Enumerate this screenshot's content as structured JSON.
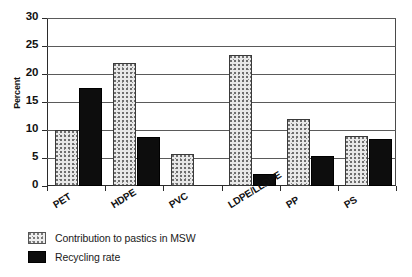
{
  "chart_data": {
    "type": "bar",
    "title": "",
    "subtitle": "",
    "xlabel": "",
    "ylabel": "Percent",
    "ylim": [
      0,
      30
    ],
    "ytick_values": [
      0,
      5,
      10,
      15,
      20,
      25,
      30
    ],
    "ytick_labels": [
      "0",
      "5",
      "10",
      "15",
      "20",
      "25",
      "30"
    ],
    "grid": true,
    "grid_axis": "y",
    "legend_position": "below-left",
    "categories": [
      "PET",
      "HDPE",
      "PVC",
      "LDPE/LLDPE",
      "PP",
      "PS"
    ],
    "series": [
      {
        "name": "Contribution to pastics in MSW",
        "color": "#e8e8e8",
        "pattern": "dotted-fill",
        "values": [
          10.0,
          22.0,
          5.8,
          23.4,
          12.0,
          9.0
        ]
      },
      {
        "name": "Recycling rate",
        "color": "#0d0d0d",
        "pattern": "solid-black",
        "values": [
          17.5,
          8.7,
          0.0,
          2.1,
          5.3,
          8.4
        ]
      }
    ],
    "annotations": []
  },
  "legend": {
    "items": [
      {
        "label": "Contribution to pastics in MSW",
        "swatch": "light-dotted"
      },
      {
        "label": "Recycling rate",
        "swatch": "solid-black"
      }
    ]
  },
  "axis": {
    "y_title": "Percent"
  }
}
